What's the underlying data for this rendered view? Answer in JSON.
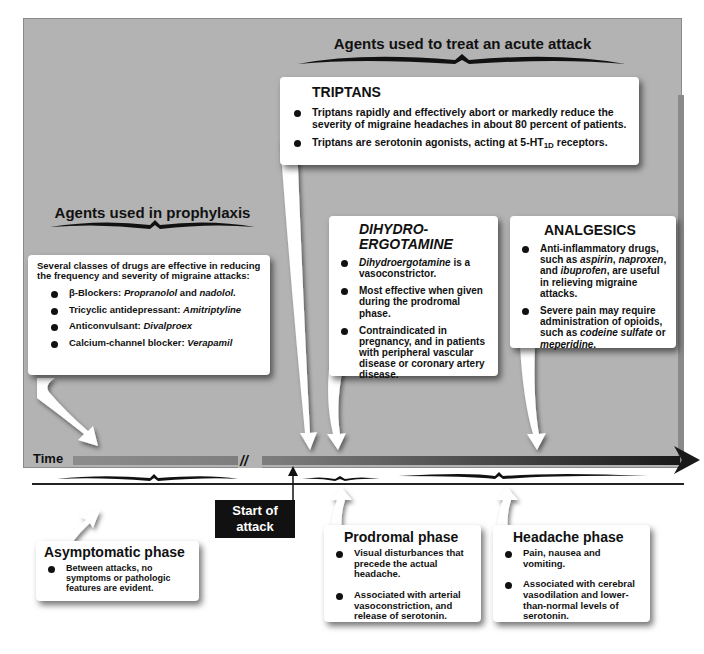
{
  "headings": {
    "acute": "Agents used to treat an acute attack",
    "prophylaxis": "Agents used in prophylaxis"
  },
  "triptans": {
    "title": "TRIPTANS",
    "items": [
      "Triptans rapidly and effectively abort or markedly reduce the severity of migraine headaches in about 80 percent of patients.",
      "Triptans are serotonin agonists, acting at 5-HT1D receptors."
    ],
    "item2_prefix": "Triptans are serotonin agonists, acting at 5-HT",
    "item2_sub": "1D",
    "item2_suffix": " receptors."
  },
  "dihydroergotamine": {
    "title_line1": "DIHYDRO-",
    "title_line2": "ERGOTAMINE",
    "item1_italic": "Dihydroergotamine",
    "item1_rest": " is a vasoconstrictor.",
    "item2": "Most effective when given during the prodromal phase.",
    "item3": "Contraindicated in pregnancy, and in patients with peripheral vascular disease or coronary artery disease."
  },
  "analgesics": {
    "title": "ANALGESICS",
    "item1": {
      "a": "Anti-inflammatory drugs, such as ",
      "aspirin": "aspirin",
      "b": ", ",
      "naproxen": "naproxen",
      "c": ", and ",
      "ibuprofen": "ibuprofen",
      "d": ", are useful in relieving migraine attacks."
    },
    "item2": {
      "a": "Severe pain may require administration of opioids, such as ",
      "codeine": "codeine sulfate",
      "b": " or ",
      "meperidine": "meperidine",
      "c": "."
    }
  },
  "prophylaxis_box": {
    "intro": "Several classes of drugs are effective in reducing the frequency and severity of migraine attacks:",
    "items": [
      {
        "label": "β-Blockers: ",
        "drug": "Propranolol",
        "mid": " and ",
        "drug2": "nadolol."
      },
      {
        "label": "Tricyclic antidepressant: ",
        "drug": "Amitriptyline"
      },
      {
        "label": "Anticonvulsant: ",
        "drug": "Divalproex"
      },
      {
        "label": "Calcium-channel blocker: ",
        "drug": "Verapamil"
      }
    ]
  },
  "timeline": {
    "label": "Time",
    "start_attack": "Start of attack",
    "break_mark": "//"
  },
  "phases": {
    "asymptomatic": {
      "title": "Asymptomatic phase",
      "items": [
        "Between attacks, no symptoms or pathologic features are evident."
      ]
    },
    "prodromal": {
      "title": "Prodromal phase",
      "items": [
        "Visual disturbances that precede the actual headache.",
        "Associated with arterial vasoconstriction, and release of serotonin."
      ]
    },
    "headache": {
      "title": "Headache phase",
      "items": [
        "Pain, nausea and vomiting.",
        "Associated with cerebral vasodilation and lower-than-normal levels of serotonin."
      ]
    }
  },
  "colors": {
    "panel": "#b3b3b3",
    "box": "#ffffff",
    "timeline_start": "#8c8c8c",
    "timeline_end": "#1a1a1a",
    "start_box": "#111111"
  }
}
